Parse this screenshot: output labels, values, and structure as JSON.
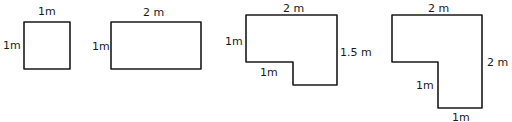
{
  "shapes": [
    {
      "name": "square",
      "labels": {
        "top": "1m",
        "left": "1m"
      }
    },
    {
      "name": "rectangle",
      "labels": {
        "top": "2 m",
        "left": "1m"
      }
    },
    {
      "name": "l-shape-small",
      "labels": {
        "top": "2 m",
        "left": "1m",
        "right": "1.5 m",
        "inner_bottom": "1m"
      }
    },
    {
      "name": "l-shape-large",
      "labels": {
        "top": "2 m",
        "right": "2 m",
        "inner_left": "1m",
        "bottom": "1m"
      }
    }
  ],
  "colors": {
    "stroke": "#1a1a1a",
    "background": "#ffffff"
  }
}
